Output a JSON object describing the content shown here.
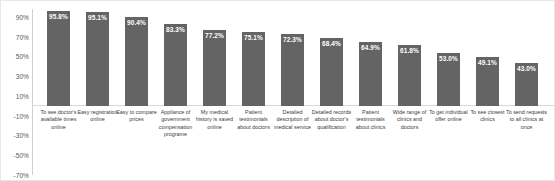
{
  "chart_data": {
    "type": "bar",
    "title": "",
    "subtitle": "",
    "xlabel": "",
    "ylabel": "",
    "ylim": [
      -70,
      90
    ],
    "yticks": [
      "90%",
      "70%",
      "50%",
      "30%",
      "10%",
      "-10%",
      "-30%",
      "-50%",
      "-70%"
    ],
    "ytick_values": [
      90,
      70,
      50,
      30,
      10,
      -10,
      -30,
      -50,
      -70
    ],
    "grid": false,
    "legend": "none",
    "bar_color": "#646464",
    "value_label_color": "#ffffff",
    "categories": [
      "To see doctor's available times online",
      "Easy registration online",
      "Easy to compare prices",
      "Appliance of government compensation programe",
      "My medical history is saved online",
      "Patient testimonials about doctors",
      "Detailed description of medical service",
      "Detailed records about doctor's qualification",
      "Patient testimonials about clinics",
      "Wide range of clinics and doctors",
      "To get individual offer online",
      "To see closest clinics",
      "To send requests to all clinics at once"
    ],
    "values": [
      95.8,
      95.1,
      90.4,
      83.3,
      77.2,
      75.1,
      72.3,
      68.4,
      64.9,
      61.8,
      53.0,
      49.1,
      43.0
    ],
    "value_labels": [
      "95.8%",
      "95.1%",
      "90.4%",
      "83.3%",
      "77.2%",
      "75.1%",
      "72.3%",
      "68.4%",
      "64.9%",
      "61.8%",
      "53.0%",
      "49.1%",
      "43.0%"
    ]
  }
}
